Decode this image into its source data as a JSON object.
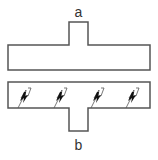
{
  "diagram": {
    "top_label": "a",
    "bottom_label": "b",
    "stroke_color": "#555555",
    "fill_color": "#ffffff",
    "glyph_color": "#111111",
    "top_block": {
      "description": "T-shaped block with tab pointing up (end a)"
    },
    "bottom_block": {
      "description": "T-shaped block with tab pointing down (end b), containing 4 lightning-bolt hatch marks",
      "mark_count": 4,
      "mark_icon": "lightning-bolt-icon"
    }
  }
}
